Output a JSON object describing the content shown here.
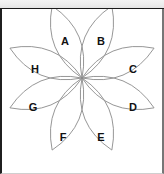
{
  "toolbar": {
    "mark": ""
  },
  "diagram": {
    "title": "",
    "shape": "eight-petal-rosette",
    "stroke_color": "#8a8a8a",
    "label_color": "#111111",
    "background_color": "#ffffff",
    "center": {
      "x": 82,
      "y": 78
    },
    "petal_count": 8,
    "petals": [
      {
        "label": "A",
        "angle_deg": -112.5,
        "label_x": 65,
        "label_y": 42
      },
      {
        "label": "B",
        "angle_deg": -67.5,
        "label_x": 101,
        "label_y": 42
      },
      {
        "label": "C",
        "angle_deg": -22.5,
        "label_x": 133,
        "label_y": 70
      },
      {
        "label": "D",
        "angle_deg": 22.5,
        "label_x": 133,
        "label_y": 108
      },
      {
        "label": "E",
        "angle_deg": 67.5,
        "label_x": 101,
        "label_y": 138
      },
      {
        "label": "F",
        "angle_deg": 112.5,
        "label_x": 63,
        "label_y": 138
      },
      {
        "label": "G",
        "angle_deg": 157.5,
        "label_x": 33,
        "label_y": 108
      },
      {
        "label": "H",
        "angle_deg": -157.5,
        "label_x": 35,
        "label_y": 70
      }
    ],
    "labels": [
      "A",
      "B",
      "C",
      "D",
      "E",
      "F",
      "G",
      "H"
    ]
  }
}
